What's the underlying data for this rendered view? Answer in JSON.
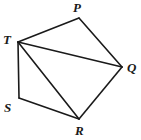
{
  "figure": {
    "type": "geometry-diagram",
    "shape_name": "pentagon PQRST with diagonals from T",
    "canvas": {
      "width": 141,
      "height": 140,
      "background": "#ffffff"
    },
    "stroke": {
      "color": "#1a1a1a",
      "width": 1.6
    },
    "fill": "none",
    "vertices": [
      {
        "id": "P",
        "label": "P",
        "x": 79,
        "y": 18,
        "label_x": 73,
        "label_y": 1,
        "label_anchor": "above"
      },
      {
        "id": "Q",
        "label": "Q",
        "x": 122,
        "y": 67,
        "label_x": 127,
        "label_y": 61,
        "label_anchor": "right"
      },
      {
        "id": "R",
        "label": "R",
        "x": 79,
        "y": 119,
        "label_x": 75,
        "label_y": 124,
        "label_anchor": "below"
      },
      {
        "id": "S",
        "label": "S",
        "x": 19,
        "y": 98,
        "label_x": 4,
        "label_y": 101,
        "label_anchor": "left"
      },
      {
        "id": "T",
        "label": "T",
        "x": 18,
        "y": 42,
        "label_x": 3,
        "label_y": 33,
        "label_anchor": "left"
      }
    ],
    "perimeter_edges": [
      {
        "id": "edge-TP",
        "from": "T",
        "to": "P"
      },
      {
        "id": "edge-PQ",
        "from": "P",
        "to": "Q"
      },
      {
        "id": "edge-QR",
        "from": "Q",
        "to": "R"
      },
      {
        "id": "edge-RS",
        "from": "R",
        "to": "S"
      },
      {
        "id": "edge-ST",
        "from": "S",
        "to": "T"
      }
    ],
    "diagonals": [
      {
        "id": "diagonal-TQ",
        "from": "T",
        "to": "Q"
      },
      {
        "id": "diagonal-TR",
        "from": "T",
        "to": "R"
      }
    ],
    "triangles": [
      {
        "id": "triangle-TPQ",
        "vertices": [
          "T",
          "P",
          "Q"
        ]
      },
      {
        "id": "triangle-TQR",
        "vertices": [
          "T",
          "Q",
          "R"
        ]
      },
      {
        "id": "triangle-TRS",
        "vertices": [
          "T",
          "R",
          "S"
        ]
      }
    ]
  }
}
